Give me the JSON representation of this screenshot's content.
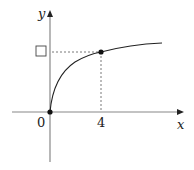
{
  "diagram": {
    "type": "function-graph",
    "axes": {
      "x_label": "x",
      "y_label": "y",
      "origin_label": "0"
    },
    "x_ticks": [
      {
        "value": 4,
        "label": "4"
      }
    ],
    "y_ticks": [
      {
        "value": null,
        "label": "blank-answer-box"
      }
    ],
    "points": [
      {
        "name": "origin",
        "x": 0,
        "y": 0
      },
      {
        "name": "point-at-4",
        "x": 4,
        "y": null
      }
    ],
    "curve": {
      "description": "increasing concave curve starting at origin, leveling off to the right"
    },
    "colors": {
      "axis": "#888888",
      "curve": "#222222",
      "dashes": "#555555",
      "point": "#111111"
    }
  }
}
